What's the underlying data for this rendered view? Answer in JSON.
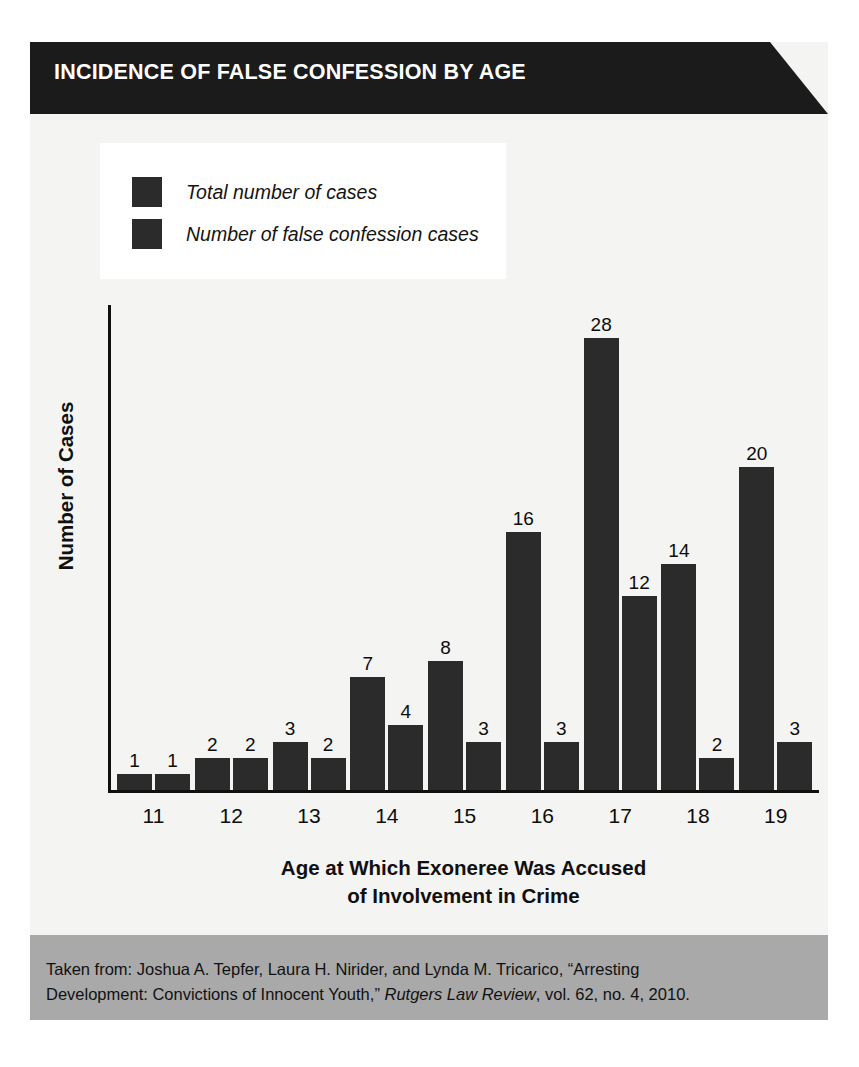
{
  "figure": {
    "title": "INCIDENCE OF FALSE CONFESSION BY AGE",
    "background_color": "#f4f4f2",
    "banner_color": "#1b1b1b",
    "bar_color": "#2b2b2b",
    "footer_color": "#a9a9a9"
  },
  "legend": {
    "items": [
      {
        "label": "Total number of cases",
        "color": "#2b2b2b"
      },
      {
        "label": "Number of false confession cases",
        "color": "#2b2b2b"
      }
    ]
  },
  "footer": {
    "line1": "Taken from: Joshua A. Tepfer, Laura H. Nirider, and Lynda M. Tricarico, “Arresting",
    "line2_a": "Development: Convictions of Innocent Youth,” ",
    "line2_italic": "Rutgers Law Review",
    "line2_b": ", vol. 62, no. 4, 2010."
  },
  "chart_data": {
    "type": "bar",
    "title": "INCIDENCE OF FALSE CONFESSION BY AGE",
    "xlabel_line1": "Age at Which Exoneree Was Accused",
    "xlabel_line2": "of Involvement in Crime",
    "ylabel": "Number of Cases",
    "categories": [
      "11",
      "12",
      "13",
      "14",
      "15",
      "16",
      "17",
      "18",
      "19"
    ],
    "series": [
      {
        "name": "Total number of cases",
        "values": [
          1,
          2,
          3,
          7,
          8,
          16,
          28,
          14,
          20
        ]
      },
      {
        "name": "Number of false confession cases",
        "values": [
          1,
          2,
          2,
          4,
          3,
          3,
          12,
          2,
          3
        ]
      }
    ],
    "ylim": [
      0,
      30
    ],
    "grid": false,
    "legend_position": "top-left",
    "data_labels": true
  }
}
